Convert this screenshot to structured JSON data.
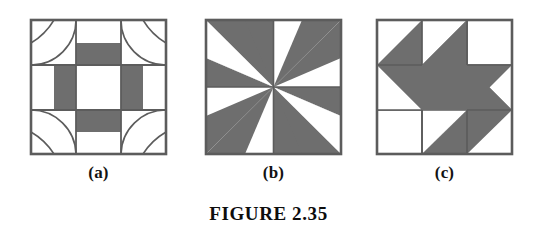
{
  "figure": {
    "caption": "FIGURE 2.35",
    "background_color": "#ffffff",
    "shade_color": "#6e6e6e",
    "line_color": "#5c5c5c",
    "blocks": [
      {
        "label": "(a)",
        "name": "quilt-block-a",
        "description": "Nine-patch quilt block: white center square, four shaded rectangles at the edge midpoints, white corner squares each containing two concentric quarter-arcs.",
        "grid": "3x3",
        "shaded_cells": [
          "top-center",
          "middle-left",
          "middle-right",
          "bottom-center"
        ],
        "white_cells": [
          "top-left",
          "top-right",
          "center",
          "bottom-left",
          "bottom-right"
        ],
        "motif": "quarter-arc-fan-in-corners"
      },
      {
        "label": "(b)",
        "name": "quilt-block-b",
        "description": "Four-quadrant pinwheel quilt block. Top-left and bottom-right quadrants are shaded with white elongated spikes; top-right and bottom-left quadrants are white with shaded elongated spikes. All spikes converge at the block center.",
        "grid": "2x2",
        "quadrants": [
          {
            "position": "top-left",
            "background": "shade",
            "spike": "white"
          },
          {
            "position": "top-right",
            "background": "white",
            "spike": "shade"
          },
          {
            "position": "bottom-left",
            "background": "white",
            "spike": "shade"
          },
          {
            "position": "bottom-right",
            "background": "shade",
            "spike": "white"
          }
        ],
        "motif": "pinwheel-spikes"
      },
      {
        "label": "(c)",
        "name": "quilt-block-c",
        "description": "Quilt block with a large shaded four-pointed star / pinwheel rotating about the center, overlaid on a three-by-three patch grid of white squares.",
        "grid": "3x3",
        "motif": "four-point-star-pinwheel"
      }
    ]
  }
}
